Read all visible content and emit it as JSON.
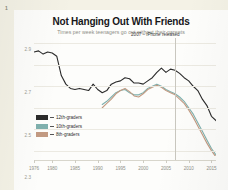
{
  "page": {
    "number": "1"
  },
  "chart_data": {
    "type": "line",
    "title": "Not Hanging Out With Friends",
    "subtitle": "Times per week teenagers go out without their parents",
    "xlabel": "",
    "ylabel": "",
    "xlim": [
      1976,
      2016
    ],
    "ylim": [
      1.85,
      2.95
    ],
    "grid": true,
    "legend_position": "bottom-left",
    "yticks": [
      "2.9",
      "2.7",
      "2.5",
      "2.3",
      "2.1",
      "1.9"
    ],
    "ytick_values": [
      2.9,
      2.7,
      2.5,
      2.3,
      2.1,
      1.9
    ],
    "xticks": [
      "1976",
      "1980",
      "1985",
      "1990",
      "1995",
      "2000",
      "2005",
      "2010",
      "2015"
    ],
    "xtick_values": [
      1976,
      1980,
      1985,
      1990,
      1995,
      2000,
      2005,
      2010,
      2015
    ],
    "annotations": [
      {
        "text": "2007 – iPhone released",
        "x": 2007,
        "type": "vertical-line-label"
      }
    ],
    "colors": {
      "12th-graders": "#2b2b2b",
      "10th-graders": "#7fb0ad",
      "8th-graders": "#c29a82",
      "background": "#fdfdfb",
      "grid": "#eceae2",
      "annotation_line": "#c9c7bf"
    },
    "series": [
      {
        "name": "12th-graders",
        "color": "#2b2b2b",
        "x": [
          1976,
          1977,
          1978,
          1979,
          1980,
          1981,
          1982,
          1983,
          1984,
          1985,
          1986,
          1987,
          1988,
          1989,
          1990,
          1991,
          1992,
          1993,
          1994,
          1995,
          1996,
          1997,
          1998,
          1999,
          2000,
          2001,
          2002,
          2003,
          2004,
          2005,
          2006,
          2007,
          2008,
          2009,
          2010,
          2011,
          2012,
          2013,
          2014,
          2015,
          2016
        ],
        "values": [
          2.82,
          2.83,
          2.8,
          2.82,
          2.81,
          2.78,
          2.6,
          2.52,
          2.48,
          2.47,
          2.48,
          2.47,
          2.46,
          2.52,
          2.47,
          2.44,
          2.46,
          2.52,
          2.54,
          2.55,
          2.58,
          2.57,
          2.53,
          2.53,
          2.52,
          2.55,
          2.58,
          2.63,
          2.67,
          2.63,
          2.66,
          2.65,
          2.62,
          2.58,
          2.55,
          2.5,
          2.46,
          2.38,
          2.32,
          2.22,
          2.18
        ]
      },
      {
        "name": "10th-graders",
        "color": "#7fb0ad",
        "x": [
          1991,
          1992,
          1993,
          1994,
          1995,
          1996,
          1997,
          1998,
          1999,
          2000,
          2001,
          2002,
          2003,
          2004,
          2005,
          2006,
          2007,
          2008,
          2009,
          2010,
          2011,
          2012,
          2013,
          2014,
          2015,
          2016
        ],
        "values": [
          2.33,
          2.36,
          2.4,
          2.44,
          2.46,
          2.47,
          2.44,
          2.42,
          2.42,
          2.44,
          2.48,
          2.5,
          2.52,
          2.5,
          2.47,
          2.45,
          2.43,
          2.4,
          2.36,
          2.3,
          2.24,
          2.16,
          2.08,
          2.0,
          1.92,
          1.86
        ]
      },
      {
        "name": "8th-graders",
        "color": "#c29a82",
        "x": [
          1991,
          1992,
          1993,
          1994,
          1995,
          1996,
          1997,
          1998,
          1999,
          2000,
          2001,
          2002,
          2003,
          2004,
          2005,
          2006,
          2007,
          2008,
          2009,
          2010,
          2011,
          2012,
          2013,
          2014,
          2015,
          2016
        ],
        "values": [
          2.3,
          2.34,
          2.38,
          2.43,
          2.46,
          2.48,
          2.45,
          2.41,
          2.4,
          2.43,
          2.47,
          2.49,
          2.51,
          2.49,
          2.46,
          2.44,
          2.42,
          2.38,
          2.34,
          2.28,
          2.21,
          2.13,
          2.05,
          1.97,
          1.9,
          1.84
        ]
      }
    ],
    "legend": [
      {
        "label": "12th-graders",
        "color": "#2b2b2b"
      },
      {
        "label": "10th-graders",
        "color": "#7fb0ad"
      },
      {
        "label": "8th-graders",
        "color": "#c29a82"
      }
    ]
  }
}
